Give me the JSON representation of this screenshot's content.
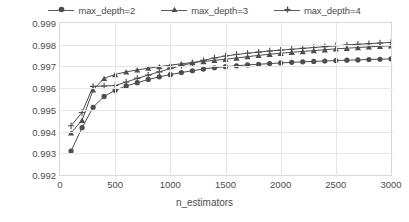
{
  "chart_data": {
    "type": "line",
    "title": "",
    "xlabel": "n_estimators",
    "ylabel": "R²",
    "xlim": [
      0,
      3000
    ],
    "ylim": [
      0.992,
      0.999
    ],
    "xticks": [
      "0",
      "500",
      "1000",
      "1500",
      "2000",
      "2500",
      "3000"
    ],
    "yticks": [
      "0.992",
      "0.993",
      "0.994",
      "0.995",
      "0.996",
      "0.997",
      "0.998",
      "0.999"
    ],
    "grid": true,
    "legend_position": "top",
    "x": [
      100,
      200,
      300,
      400,
      500,
      600,
      700,
      800,
      900,
      1000,
      1100,
      1200,
      1300,
      1400,
      1500,
      1600,
      1700,
      1800,
      1900,
      2000,
      2100,
      2200,
      2300,
      2400,
      2500,
      2600,
      2700,
      2800,
      2900,
      3000
    ],
    "series": [
      {
        "name": "max_depth=2",
        "marker": "circle",
        "color": "#4d4d4d",
        "values": [
          0.9931,
          0.99418,
          0.99512,
          0.99562,
          0.9959,
          0.9961,
          0.99625,
          0.9964,
          0.99652,
          0.99662,
          0.99672,
          0.9968,
          0.99688,
          0.99694,
          0.99699,
          0.99703,
          0.99707,
          0.9971,
          0.99713,
          0.99716,
          0.99719,
          0.99721,
          0.99723,
          0.99725,
          0.99727,
          0.99729,
          0.9973,
          0.99732,
          0.99733,
          0.99735
        ]
      },
      {
        "name": "max_depth=3",
        "marker": "triangle",
        "color": "#4d4d4d",
        "values": [
          0.99394,
          0.99452,
          0.99592,
          0.99645,
          0.99663,
          0.99675,
          0.99684,
          0.99692,
          0.99699,
          0.99706,
          0.99712,
          0.99718,
          0.99723,
          0.99728,
          0.99733,
          0.99739,
          0.99745,
          0.99751,
          0.99756,
          0.99761,
          0.99765,
          0.99769,
          0.99773,
          0.99777,
          0.99781,
          0.99784,
          0.99787,
          0.9979,
          0.99793,
          0.99795
        ]
      },
      {
        "name": "max_depth=4",
        "marker": "plus",
        "color": "#4d4d4d",
        "values": [
          0.99427,
          0.99488,
          0.99608,
          0.9961,
          0.99612,
          0.99628,
          0.99645,
          0.9966,
          0.99675,
          0.9969,
          0.99704,
          0.99716,
          0.99728,
          0.99739,
          0.99748,
          0.99755,
          0.99761,
          0.99766,
          0.99771,
          0.99775,
          0.99779,
          0.99783,
          0.99787,
          0.99791,
          0.99795,
          0.99799,
          0.99802,
          0.99805,
          0.99808,
          0.9981
        ]
      }
    ]
  }
}
